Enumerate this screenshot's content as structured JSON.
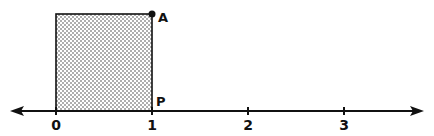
{
  "diagram": {
    "type": "number-line-with-square",
    "number_line": {
      "ticks": [
        {
          "value": 0,
          "label": "0",
          "x": 56
        },
        {
          "value": 1,
          "label": "1",
          "x": 152
        },
        {
          "value": 2,
          "label": "2",
          "x": 248
        },
        {
          "value": 3,
          "label": "3",
          "x": 344
        }
      ],
      "arrows": "both"
    },
    "square": {
      "from": 0,
      "to": 1,
      "fill": "dotted"
    },
    "points": {
      "A": {
        "label": "A"
      },
      "P": {
        "label": "P"
      }
    },
    "colors": {
      "line": "#111111",
      "dots": "#333333",
      "background": "#ffffff"
    }
  }
}
